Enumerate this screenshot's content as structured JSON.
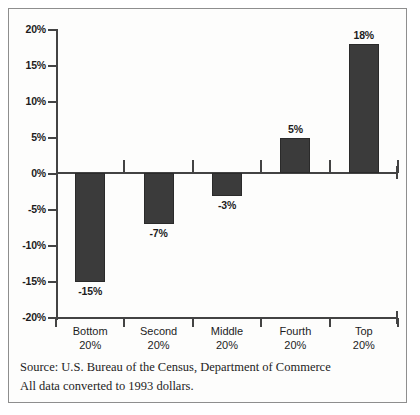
{
  "chart_data": {
    "type": "bar",
    "title": "",
    "subtitle": "",
    "xlabel": "",
    "ylabel": "",
    "categories": [
      "Bottom\n20%",
      "Second\n20%",
      "Middle\n20%",
      "Fourth\n20%",
      "Top\n20%"
    ],
    "category_lines": [
      [
        "Bottom",
        "20%"
      ],
      [
        "Second",
        "20%"
      ],
      [
        "Middle",
        "20%"
      ],
      [
        "Fourth",
        "20%"
      ],
      [
        "Top",
        "20%"
      ]
    ],
    "values": [
      -15,
      -7,
      -3,
      5,
      18
    ],
    "value_labels": [
      "-15%",
      "-7%",
      "-3%",
      "5%",
      "18%"
    ],
    "ylim": [
      -20,
      20
    ],
    "yticks": [
      20,
      15,
      10,
      5,
      0,
      -5,
      -10,
      -15,
      -20
    ],
    "ytick_labels": [
      "20%",
      "15%",
      "10%",
      "5%",
      "0%",
      "-5%",
      "-10%",
      "-15%",
      "-20%"
    ],
    "grid": false,
    "legend": null,
    "bar_color": "#3b3b3b",
    "axis_color": "#434343",
    "background_color": "#fdfdfc"
  },
  "footer": {
    "source_line": "Source: U.S. Bureau of the Census, Department of Commerce",
    "note_line": "All data converted to 1993 dollars."
  }
}
